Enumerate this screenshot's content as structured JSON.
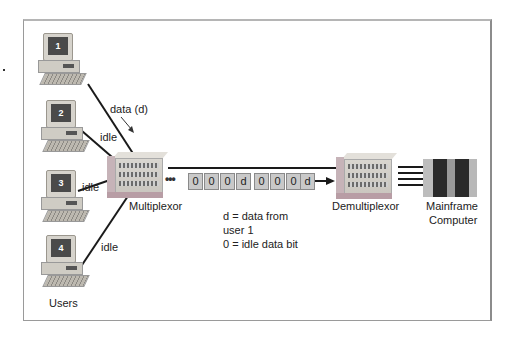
{
  "diagram": {
    "title_hidden": "",
    "users_label": "Users",
    "users": [
      {
        "id": "1",
        "link_label": "data (d)"
      },
      {
        "id": "2",
        "link_label": "idle"
      },
      {
        "id": "3",
        "link_label": "idle"
      },
      {
        "id": "4",
        "link_label": "idle"
      }
    ],
    "multiplexor_label": "Multiplexor",
    "demultiplexor_label": "Demultiplexor",
    "mainframe_label_line1": "Mainframe",
    "mainframe_label_line2": "Computer",
    "stream_leading": "•••",
    "stream_frames": [
      "0",
      "0",
      "0",
      "d",
      "0",
      "0",
      "0",
      "d"
    ],
    "legend": {
      "line1": "d = data from",
      "line2": "user 1",
      "line3": "0 = idle data bit"
    },
    "colors": {
      "frame_border": "#9a9a9a",
      "bit_box": "#c9c9c9",
      "wire": "#1a1a1a",
      "mux_accent": "#b89da5"
    }
  }
}
